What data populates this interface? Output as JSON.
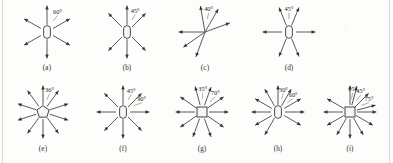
{
  "figure": {
    "name": "force-vector-diagrams",
    "panel_count": 9,
    "stroke_color": "#2e2e2e",
    "body_fill": "#f7f7f5",
    "background": "#fdfdfc"
  },
  "panels": [
    {
      "id": "a",
      "caption": "(a)",
      "body_shape": "rounded-rectangle-vertical",
      "arrow_count": 6,
      "angles_deg": [
        90,
        30,
        330,
        270,
        210,
        150
      ],
      "labels": [
        {
          "text": "60°",
          "at_deg": 60
        }
      ]
    },
    {
      "id": "b",
      "caption": "(b)",
      "body_shape": "rounded-rectangle-vertical",
      "arrow_count": 6,
      "angles_deg": [
        90,
        45,
        315,
        270,
        225,
        135
      ],
      "labels": [
        {
          "text": "45°",
          "at_deg": 67
        }
      ]
    },
    {
      "id": "c",
      "caption": "(c)",
      "body_shape": "point",
      "arrow_count": 6,
      "angles_deg": [
        100,
        60,
        20,
        250,
        215,
        180
      ],
      "labels": [
        {
          "text": "40°",
          "at_deg": 80
        }
      ]
    },
    {
      "id": "d",
      "caption": "(d)",
      "body_shape": "rounded-rectangle-vertical",
      "arrow_count": 6,
      "angles_deg": [
        112,
        68,
        180,
        0,
        248,
        292
      ],
      "labels": [
        {
          "text": "45°",
          "at_deg": 90
        }
      ]
    },
    {
      "id": "e",
      "caption": "(e)",
      "body_shape": "pentagon",
      "arrow_count": 10,
      "angles_deg": [
        90,
        54,
        18,
        342,
        306,
        270,
        234,
        198,
        162,
        126
      ],
      "labels": [
        {
          "text": "36°",
          "at_deg": 72
        }
      ]
    },
    {
      "id": "f",
      "caption": "(f)",
      "body_shape": "rounded-rectangle-vertical",
      "arrow_count": 8,
      "angles_deg": [
        90,
        45,
        0,
        315,
        270,
        225,
        180,
        135
      ],
      "labels": [
        {
          "text": "45°",
          "at_deg": 67
        },
        {
          "text": "90°",
          "at_deg": 30
        }
      ]
    },
    {
      "id": "g",
      "caption": "(g)",
      "body_shape": "square",
      "arrow_count": 10,
      "angles_deg": [
        105,
        70,
        35,
        0,
        325,
        290,
        250,
        215,
        180,
        145
      ],
      "labels": [
        {
          "text": "35°",
          "at_deg": 88
        },
        {
          "text": "70°",
          "at_deg": 52
        }
      ]
    },
    {
      "id": "h",
      "caption": "(h)",
      "body_shape": "rounded-rectangle-vertical",
      "arrow_count": 10,
      "angles_deg": [
        90,
        60,
        30,
        0,
        330,
        240,
        210,
        180,
        150,
        120
      ],
      "labels": [
        {
          "text": "30°",
          "at_deg": 75
        },
        {
          "text": "60°",
          "at_deg": 45
        }
      ]
    },
    {
      "id": "i",
      "caption": "(i)",
      "body_shape": "square",
      "arrow_count": 12,
      "angles_deg": [
        90,
        75,
        45,
        15,
        0,
        330,
        300,
        270,
        240,
        210,
        180,
        150
      ],
      "labels": [
        {
          "text": "15°",
          "at_deg": 83
        },
        {
          "text": "45°",
          "at_deg": 60
        },
        {
          "text": "75°",
          "at_deg": 30
        }
      ]
    }
  ]
}
